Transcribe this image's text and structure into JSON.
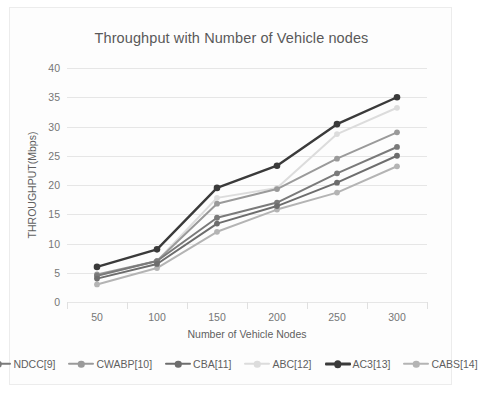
{
  "chart_data": {
    "type": "line",
    "title": "Throughput with Number of Vehicle nodes",
    "xlabel": "Number of Vehicle Nodes",
    "ylabel": "THROUGHPUT(Mbps)",
    "categories": [
      "50",
      "100",
      "150",
      "200",
      "250",
      "300"
    ],
    "x": [
      50,
      100,
      150,
      200,
      250,
      300
    ],
    "ylim": [
      0,
      40
    ],
    "yticks": [
      "0",
      "5",
      "10",
      "15",
      "20",
      "25",
      "30",
      "35",
      "40"
    ],
    "ytick_values": [
      0,
      5,
      10,
      15,
      20,
      25,
      30,
      35,
      40
    ],
    "grid": true,
    "legend_position": "bottom",
    "series": [
      {
        "name": "NDCC[9]",
        "color": "#7a7a7a",
        "values": [
          4.5,
          7.0,
          14.4,
          17.0,
          22.0,
          26.5
        ]
      },
      {
        "name": "CWABP[10]",
        "color": "#9a9a9a",
        "values": [
          4.7,
          7.0,
          16.8,
          19.3,
          24.5,
          29.0
        ]
      },
      {
        "name": "CBA[11]",
        "color": "#6d6d6d",
        "values": [
          4.0,
          6.5,
          13.4,
          16.4,
          20.4,
          25.0
        ]
      },
      {
        "name": "ABC[12]",
        "color": "#dcdcdc",
        "values": [
          4.5,
          7.0,
          17.8,
          19.5,
          28.7,
          33.2
        ]
      },
      {
        "name": "AC3[13]",
        "color": "#3a3a3a",
        "values": [
          6.0,
          9.0,
          19.5,
          23.3,
          30.4,
          35.0
        ]
      },
      {
        "name": "CABS[14]",
        "color": "#b4b4b4",
        "values": [
          3.0,
          5.8,
          12.0,
          15.8,
          18.7,
          23.2
        ]
      }
    ]
  },
  "colors": {
    "card_background": "#fdfdfd",
    "card_border": "#ececec",
    "gridline": "#e6e6e6",
    "text": "#5f5f5f",
    "tick_text": "#767676"
  }
}
